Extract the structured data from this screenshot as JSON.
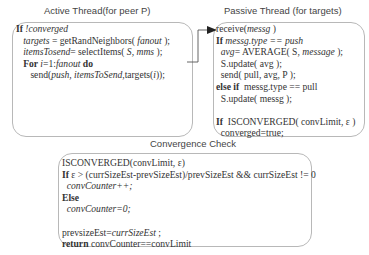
{
  "active": {
    "title": "Active Thread(for peer P)",
    "lines": [
      [
        {
          "t": "If ",
          "s": "b"
        },
        {
          "t": "!converged",
          "s": "i"
        }
      ],
      [
        {
          "t": "   "
        },
        {
          "t": "targets",
          "s": "i"
        },
        {
          "t": " = getRandNeighbors( "
        },
        {
          "t": "fanout",
          "s": "i"
        },
        {
          "t": " );"
        }
      ],
      [
        {
          "t": "   "
        },
        {
          "t": "itemsTosend",
          "s": "i"
        },
        {
          "t": "= selectItems( "
        },
        {
          "t": "S, mms",
          "s": "i"
        },
        {
          "t": " );"
        }
      ],
      [
        {
          "t": "   "
        },
        {
          "t": "For ",
          "s": "b"
        },
        {
          "t": "i",
          "s": "i"
        },
        {
          "t": "=1:"
        },
        {
          "t": "fanout",
          "s": "i"
        },
        {
          "t": " do",
          "s": "b"
        }
      ],
      [
        {
          "t": "      send("
        },
        {
          "t": "push, itemsToSend",
          "s": "i"
        },
        {
          "t": ",targets("
        },
        {
          "t": "i",
          "s": "i"
        },
        {
          "t": "));"
        }
      ]
    ]
  },
  "passive": {
    "title": "Passive Thread (for targets)",
    "lines": [
      [
        {
          "t": "receive("
        },
        {
          "t": "messg",
          "s": "i"
        },
        {
          "t": " )"
        }
      ],
      [
        {
          "t": "If ",
          "s": "b"
        },
        {
          "t": "messg.type == push",
          "s": "i"
        }
      ],
      [
        {
          "t": "  "
        },
        {
          "t": "avg",
          "s": "i"
        },
        {
          "t": "= AVERAGE( S, "
        },
        {
          "t": "message",
          "s": "i"
        },
        {
          "t": " );"
        }
      ],
      [
        {
          "t": "  S.update( avg );"
        }
      ],
      [
        {
          "t": "  send( pull, avg, P );"
        }
      ],
      [
        {
          "t": "else if",
          "s": "b"
        },
        {
          "t": "  messg.type == pull"
        }
      ],
      [
        {
          "t": "  S.update( messg );"
        }
      ],
      [
        {
          "t": ""
        }
      ],
      [
        {
          "t": "If ",
          "s": "b"
        },
        {
          "t": " ISCONVERGED( convLimit, ε )"
        }
      ],
      [
        {
          "t": "  converged=true;"
        }
      ]
    ]
  },
  "convergence": {
    "title": "Convergence Check",
    "lines": [
      [
        {
          "t": "ISCONVERGED(convLimit, ε)"
        }
      ],
      [
        {
          "t": "If ",
          "s": "b"
        },
        {
          "t": "ε > (currSizeEst-prevSizeEst)/prevSizeEst && currSizeEst != 0"
        }
      ],
      [
        {
          "t": "  "
        },
        {
          "t": "convCounter++;",
          "s": "i"
        }
      ],
      [
        {
          "t": "Else",
          "s": "b"
        }
      ],
      [
        {
          "t": "  "
        },
        {
          "t": "convCounter=0;",
          "s": "i"
        }
      ],
      [
        {
          "t": ""
        }
      ],
      [
        {
          "t": "prevsizeEst="
        },
        {
          "t": "currSizeEst",
          "s": "i"
        },
        {
          "t": " ;"
        }
      ],
      [
        {
          "t": "return ",
          "s": "b"
        },
        {
          "t": "convCounter==convLimit"
        }
      ]
    ]
  }
}
